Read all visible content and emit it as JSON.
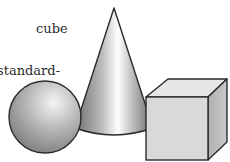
{
  "caption": {
    "line1": "cube",
    "line2": "standard-"
  },
  "figure": {
    "shapes": [
      {
        "kind": "cone",
        "label": "cone-shape"
      },
      {
        "kind": "sphere",
        "label": "sphere-shape"
      },
      {
        "kind": "cube",
        "label": "cube-shape"
      }
    ],
    "colors": {
      "outline": "#2b2b2b",
      "cube_front": "#d9d9d9",
      "cube_top": "#e6e6e6",
      "cube_side": "#bdbdbd",
      "sphere_light": "#f2f2f2",
      "sphere_dark": "#7a7a7a",
      "cone_light": "#ffffff",
      "cone_dark": "#6e6e6e"
    }
  }
}
